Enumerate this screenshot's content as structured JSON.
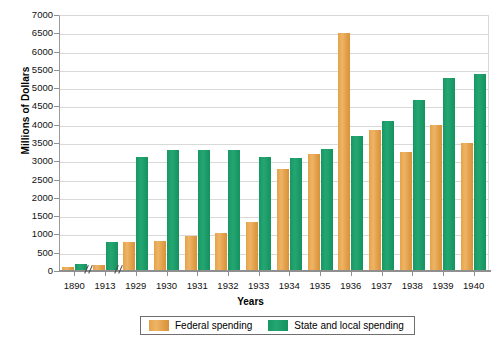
{
  "chart_data": {
    "type": "bar",
    "title": "",
    "xlabel": "Years",
    "ylabel": "Millions of Dollars",
    "ylim": [
      0,
      7000
    ],
    "ytick_step": 500,
    "yticks": [
      "7000",
      "6500",
      "6000",
      "5500",
      "5000",
      "4500",
      "4000",
      "3500",
      "3000",
      "2500",
      "2000",
      "1500",
      "1000",
      "500",
      "0"
    ],
    "grid": true,
    "legend_position": "bottom-center",
    "axis_breaks": [
      "after 1890",
      "after 1913"
    ],
    "categories": [
      "1890",
      "1913",
      "1929",
      "1930",
      "1931",
      "1932",
      "1933",
      "1934",
      "1935",
      "1936",
      "1937",
      "1938",
      "1939",
      "1940"
    ],
    "series": [
      {
        "name": "Federal spending",
        "color": "#E8A854",
        "values": [
          100,
          175,
          800,
          830,
          950,
          1030,
          1350,
          2800,
          3200,
          6500,
          3850,
          3250,
          4000,
          3500
        ]
      },
      {
        "name": "State and local spending",
        "color": "#1C9E6E",
        "values": [
          200,
          800,
          3130,
          3300,
          3300,
          3320,
          3120,
          3080,
          3330,
          3680,
          4100,
          4680,
          5280,
          5400
        ]
      }
    ]
  },
  "legend": {
    "items": [
      {
        "label": "Federal spending",
        "swatch": "federal-swatch"
      },
      {
        "label": "State and local spending",
        "swatch": "state-local-swatch"
      }
    ]
  }
}
